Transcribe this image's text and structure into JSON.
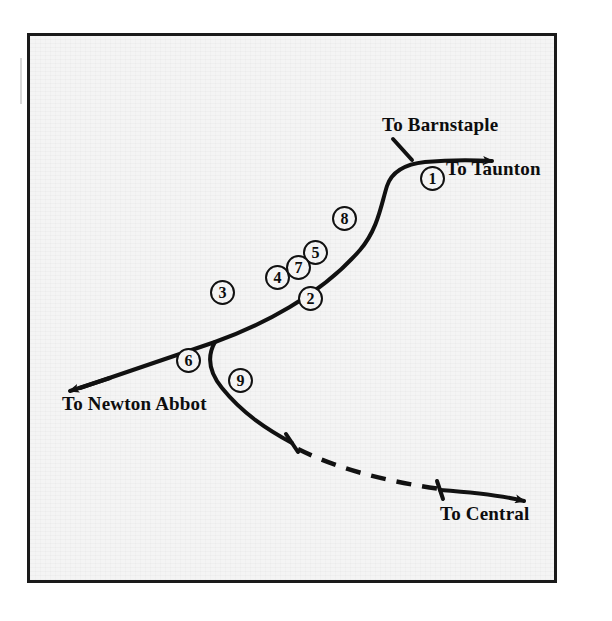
{
  "figure": {
    "kind": "railway-route-diagram",
    "background_color": "#f4f4f4",
    "line_color": "#111111",
    "border_color": "#1a1a1a",
    "frame": {
      "left": 27,
      "top": 33,
      "width": 530,
      "height": 550
    }
  },
  "destinations": [
    {
      "id": "barnstaple",
      "label": "To Barnstaple",
      "x": 382,
      "y": 114,
      "arrow": "up-right"
    },
    {
      "id": "taunton",
      "label": "To Taunton",
      "x": 446,
      "y": 158,
      "arrow": "right"
    },
    {
      "id": "newton-abbot",
      "label": "To Newton Abbot",
      "x": 62,
      "y": 393,
      "arrow": "down-left"
    },
    {
      "id": "central",
      "label": "To Central",
      "x": 440,
      "y": 503,
      "arrow": "right"
    }
  ],
  "site_markers": [
    {
      "number": "1",
      "x": 420,
      "y": 166
    },
    {
      "number": "2",
      "x": 298,
      "y": 286
    },
    {
      "number": "3",
      "x": 210,
      "y": 280
    },
    {
      "number": "4",
      "x": 265,
      "y": 265
    },
    {
      "number": "5",
      "x": 303,
      "y": 240
    },
    {
      "number": "6",
      "x": 176,
      "y": 348
    },
    {
      "number": "7",
      "x": 286,
      "y": 255
    },
    {
      "number": "8",
      "x": 332,
      "y": 206
    },
    {
      "number": "9",
      "x": 228,
      "y": 368
    }
  ],
  "track_segments": [
    {
      "id": "main-line",
      "style": "solid",
      "description": "Newton Abbot to Taunton main line"
    },
    {
      "id": "barnstaple-branch",
      "style": "solid",
      "description": "branch stub to Barnstaple"
    },
    {
      "id": "central-branch-upper",
      "style": "solid",
      "description": "branch from junction heading south-east"
    },
    {
      "id": "central-branch-dashed",
      "style": "dashed",
      "description": "dismantled or projected section"
    },
    {
      "id": "central-branch-lower",
      "style": "solid",
      "description": "section into Central"
    }
  ]
}
